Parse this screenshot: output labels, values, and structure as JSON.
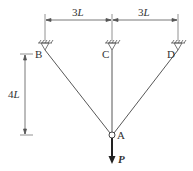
{
  "diagram": {
    "type": "three-bar truss with load",
    "dimensions": {
      "left_span": {
        "value": "3",
        "unit": "L"
      },
      "right_span": {
        "value": "3",
        "unit": "L"
      },
      "height": {
        "value": "4",
        "unit": "L"
      }
    },
    "supports": [
      {
        "label": "B",
        "position": "left"
      },
      {
        "label": "C",
        "position": "center"
      },
      {
        "label": "D",
        "position": "right"
      }
    ],
    "joint": {
      "label": "A"
    },
    "load": {
      "label": "P",
      "direction": "down"
    },
    "colors": {
      "line": "#555555",
      "load": "#333333",
      "text": "#333333"
    }
  }
}
